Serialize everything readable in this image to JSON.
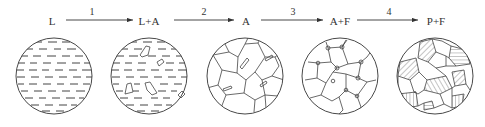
{
  "diagram": {
    "type": "phase-transformation-sequence",
    "stages": [
      {
        "label": "L",
        "cx": 54,
        "structure": "liquid"
      },
      {
        "label": "L+A",
        "cx": 149,
        "structure": "liquid-with-austenite-crystals"
      },
      {
        "label": "A",
        "cx": 245,
        "structure": "austenite-grains"
      },
      {
        "label": "A+F",
        "cx": 340,
        "structure": "austenite-with-ferrite-at-boundaries"
      },
      {
        "label": "P+F",
        "cx": 435,
        "structure": "pearlite-and-ferrite"
      }
    ],
    "transitions": [
      {
        "number": "1",
        "from": "L",
        "to": "L+A"
      },
      {
        "number": "2",
        "from": "L+A",
        "to": "A"
      },
      {
        "number": "3",
        "from": "A",
        "to": "A+F"
      },
      {
        "number": "4",
        "from": "A+F",
        "to": "P+F"
      }
    ],
    "colors": {
      "line": "#333333",
      "background": "#ffffff"
    }
  }
}
